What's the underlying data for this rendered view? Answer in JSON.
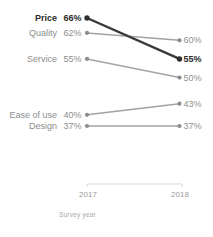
{
  "chart_data": {
    "type": "line",
    "subtype": "slopegraph",
    "title": "",
    "xlabel": "Survey year",
    "ylabel": "",
    "categories": [
      "2017",
      "2018"
    ],
    "value_suffix": "%",
    "ylim": [
      37,
      66
    ],
    "grid": false,
    "legend": "none",
    "series": [
      {
        "name": "Price",
        "values": [
          66,
          55
        ],
        "emphasis": true
      },
      {
        "name": "Quality",
        "values": [
          62,
          60
        ],
        "emphasis": false
      },
      {
        "name": "Service",
        "values": [
          55,
          50
        ],
        "emphasis": false
      },
      {
        "name": "Ease of use",
        "values": [
          40,
          43
        ],
        "emphasis": false
      },
      {
        "name": "Design",
        "values": [
          37,
          37
        ],
        "emphasis": false
      }
    ],
    "colors": {
      "emphasis_line": "#3a3a3a",
      "emphasis_point": "#2f2f2f",
      "emphasis_text": "#2b2b2b",
      "normal_line": "#a3a3a3",
      "normal_point": "#8c8c8c",
      "normal_text": "#8c8c8c",
      "value_text": "#919191",
      "axis_line": "#d9d9d9",
      "tick_text": "#9c9c9c",
      "axis_title_text": "#a8a8a8",
      "background": "#ffffff"
    }
  }
}
